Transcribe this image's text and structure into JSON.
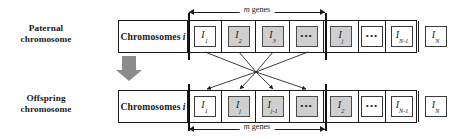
{
  "figure": {
    "type": "crossover-diagram",
    "title_paternal": "Paternal\nchromosome",
    "measure_label_prefix": "m",
    "measure_label_suffix": " genes"
  },
  "labels": {
    "paternal_line1": "Paternal",
    "paternal_line2": "chromosome",
    "offspring_line1": "Offspring",
    "offspring_line2": "chromosome"
  },
  "measures": {
    "top": {
      "italic": "m",
      "text": " genes"
    },
    "bottom": {
      "italic": "m",
      "text": " genes"
    }
  },
  "paternal_row": {
    "title": "Chromosomes",
    "title_italic": "i",
    "genes": [
      {
        "sym": "I",
        "sub": "1",
        "shaded": false,
        "ellipsis": false
      },
      {
        "sym": "I",
        "sub": "2",
        "shaded": true,
        "ellipsis": false
      },
      {
        "sym": "I",
        "sub": "3",
        "shaded": true,
        "ellipsis": false
      },
      {
        "sym": "",
        "sub": "",
        "shaded": true,
        "ellipsis": true
      },
      {
        "sym": "I",
        "sub": "j",
        "shaded": true,
        "ellipsis": false
      },
      {
        "sym": "",
        "sub": "",
        "shaded": false,
        "ellipsis": true
      },
      {
        "sym": "I",
        "sub": "N-1",
        "shaded": false,
        "ellipsis": false
      },
      {
        "sym": "I",
        "sub": "N",
        "shaded": false,
        "ellipsis": false
      }
    ]
  },
  "offspring_row": {
    "title": "Chromosomes",
    "title_italic": "i",
    "genes": [
      {
        "sym": "I",
        "sub": "1",
        "shaded": false,
        "ellipsis": false
      },
      {
        "sym": "I",
        "sub": "j",
        "shaded": true,
        "ellipsis": false
      },
      {
        "sym": "I",
        "sub": "j-1",
        "shaded": true,
        "ellipsis": false
      },
      {
        "sym": "",
        "sub": "",
        "shaded": true,
        "ellipsis": true
      },
      {
        "sym": "I",
        "sub": "2",
        "shaded": true,
        "ellipsis": false
      },
      {
        "sym": "",
        "sub": "",
        "shaded": false,
        "ellipsis": true
      },
      {
        "sym": "I",
        "sub": "N-1",
        "shaded": false,
        "ellipsis": false
      },
      {
        "sym": "I",
        "sub": "N",
        "shaded": false,
        "ellipsis": false
      }
    ]
  },
  "colors": {
    "stroke": "#1a1a1a",
    "shaded_fill": "#cfcfcf",
    "arrow_gray": "#8c8c8c",
    "background": "#ffffff"
  },
  "transition_arrow": {
    "direction": "down",
    "color": "#8c8c8c"
  },
  "crossover": {
    "converge_point": [
      256,
      72
    ],
    "sources": [
      "I2",
      "I3",
      "ellipsis",
      "Ij"
    ],
    "targets": [
      "Ij",
      "Ij-1",
      "ellipsis",
      "I2"
    ]
  }
}
